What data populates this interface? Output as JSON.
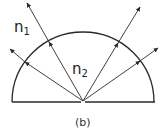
{
  "diagram": {
    "caption": "(b)",
    "labels": {
      "outer_medium": {
        "base": "n",
        "sub": "1"
      },
      "inner_medium": {
        "base": "n",
        "sub": "2"
      }
    },
    "colors": {
      "stroke": "#2a2a2a",
      "background": "#ffffff"
    },
    "shape": "semicircle",
    "rays_count": 4
  }
}
